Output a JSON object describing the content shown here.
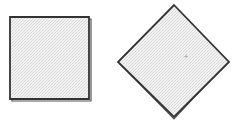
{
  "figure": {
    "width": 236,
    "height": 121,
    "background": "#ffffff",
    "stroke_color": "#333333",
    "fill_color": "#ececec",
    "shapes": [
      {
        "name": "square",
        "points": "10,17 89,17 89,99 10,99",
        "shadow_points": "12,19 91,19 91,101 12,101"
      },
      {
        "name": "diamond",
        "points": "174,5 229,62 174,117 118,62",
        "shadow_points": "174,7 227,62 174,119 120,64",
        "center_mark": {
          "x": 186,
          "y": 58,
          "glyph": "+"
        }
      }
    ]
  }
}
